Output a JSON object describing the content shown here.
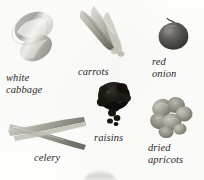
{
  "page": {
    "kind": "illustrated-ingredient-plate",
    "background_color": "#fdfdfc",
    "caption_color": "#2b2a28"
  },
  "items": [
    {
      "id": "white-cabbage",
      "label": "white\ncabbage",
      "art_name": "white-cabbage-photo",
      "colors": {
        "body": "#bdbdb8",
        "highlight": "#f2f1ec",
        "shadow": "#8e8e88"
      }
    },
    {
      "id": "carrots",
      "label": "carrots",
      "art_name": "carrots-photo",
      "colors": {
        "body": "#b9b5ab",
        "highlight": "#e8e6de",
        "shadow": "#6f6c63"
      }
    },
    {
      "id": "red-onion",
      "label": "red\nonion",
      "art_name": "red-onion-photo",
      "colors": {
        "body": "#5d5b57",
        "highlight": "#9a9792",
        "shadow": "#353431"
      }
    },
    {
      "id": "raisins",
      "label": "raisins",
      "art_name": "raisins-photo",
      "colors": {
        "body": "#15140f",
        "highlight": "#4a4840",
        "shadow": "#000000"
      }
    },
    {
      "id": "celery",
      "label": "celery",
      "art_name": "celery-photo",
      "colors": {
        "body": "#b4b3a9",
        "highlight": "#dedcd2",
        "shadow": "#76756c"
      }
    },
    {
      "id": "dried-apricots",
      "label": "dried\napricots",
      "art_name": "dried-apricots-photo",
      "colors": {
        "body": "#9e9b91",
        "highlight": "#c9c6bc",
        "shadow": "#636158"
      }
    },
    {
      "id": "cropped-bottom-object",
      "label": "",
      "art_name": "cropped-object-photo",
      "colors": {
        "body": "#cfcec8",
        "highlight": "#eceae4",
        "shadow": "#b4b3ac"
      }
    }
  ]
}
